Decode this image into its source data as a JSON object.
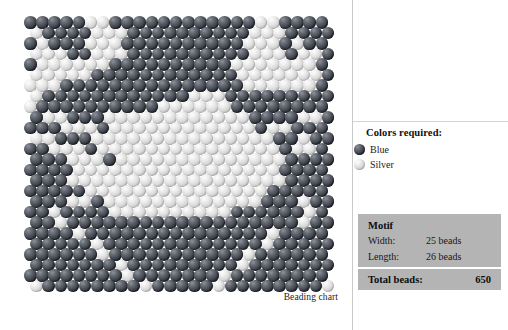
{
  "chart": {
    "caption": "Beading chart",
    "bead_size_px": 12.6,
    "row_height_px": 10.55,
    "stagger_px": 6.3,
    "colors": {
      "blue": "#2e323a",
      "silver": "#dcdcdc"
    },
    "grid": {
      "width_beads": 25,
      "length_beads": 26,
      "legend_codes": {
        "1": "blue",
        "0": "silver"
      },
      "rows": [
        "1111100111111111111001111",
        "0111100011111111110001111",
        "1011100011111111110001011",
        "0001100011111111110001001",
        "1000000111111111100000001",
        "0000011111111111100000001",
        "0001111111111111110000001",
        "0111111111111000111111111",
        "0111111111100000011111111",
        "1001110000000000001111001",
        "1110001000000000000100111",
        "0011100000000000000011011",
        "1100010000000000000001001",
        "1110001000000000000001111",
        "1111000000000000000001111",
        "1110000000000000000001111",
        "1111100000000000000011111",
        "1110010000000000000111011",
        "1101111000000000011111101",
        "1101111111111111111111011",
        "1111011111111111111101111",
        "1111101111111111111011111",
        "1111110111111111110111111",
        "1111111011111111101111111",
        "1111111101111111011111111",
        "0111111110111110111111110"
      ]
    }
  },
  "legend": {
    "title": "Colors required:",
    "items": [
      {
        "label": "Blue",
        "swatch": "blue"
      },
      {
        "label": "Silver",
        "swatch": "silver"
      }
    ]
  },
  "motif": {
    "heading": "Motif",
    "rows": [
      {
        "key": "Width:",
        "value": "25 beads"
      },
      {
        "key": "Length:",
        "value": "26 beads"
      }
    ],
    "total_label": "Total beads:",
    "total_value": "650",
    "background": "#b4b4b4"
  }
}
